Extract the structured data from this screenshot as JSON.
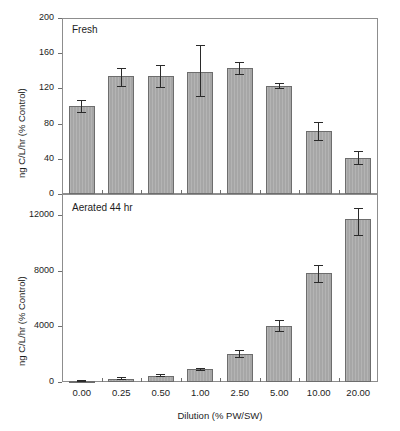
{
  "figure": {
    "shared_xlabel": "Dilution (% PW/SW)",
    "shared_ylabel": "ng C/L/hr (% Control)",
    "categories": [
      "0.00",
      "0.25",
      "0.50",
      "1.00",
      "2.50",
      "5.00",
      "10.00",
      "20.00"
    ],
    "bar_color": "#a6a6a6",
    "bar_edge_color": "#6d6d6d",
    "error_color": "#2a2a2a",
    "frame_color": "#8d8d8d"
  },
  "chart_data": [
    {
      "type": "bar",
      "title": "Fresh",
      "panel": "top",
      "xlabel": "",
      "ylabel": "ng C/L/hr (% Control)",
      "categories": [
        "0.00",
        "0.25",
        "0.50",
        "1.00",
        "2.50",
        "5.00",
        "10.00",
        "20.00"
      ],
      "values": [
        100,
        134,
        134,
        139,
        143,
        123,
        72,
        41
      ],
      "errors_low": [
        92,
        122,
        120,
        110,
        135,
        119,
        60,
        33
      ],
      "errors_high": [
        107,
        143,
        147,
        169,
        150,
        126,
        82,
        49
      ],
      "ylim": [
        0,
        200
      ],
      "yticks": [
        0,
        40,
        80,
        120,
        160,
        200
      ],
      "yticklabels": [
        "0",
        "40",
        "80",
        "120",
        "160",
        "200"
      ],
      "grid": false,
      "legend": "none",
      "annotations": [
        "Fresh"
      ]
    },
    {
      "type": "bar",
      "title": "Aerated 44 hr",
      "panel": "bottom",
      "xlabel": "Dilution (% PW/SW)",
      "ylabel": "ng C/L/hr (% Control)",
      "categories": [
        "0.00",
        "0.25",
        "0.50",
        "1.00",
        "2.50",
        "5.00",
        "10.00",
        "20.00"
      ],
      "values": [
        60,
        250,
        430,
        900,
        2000,
        4000,
        7800,
        11700
      ],
      "errors_low": [
        20,
        170,
        330,
        820,
        1750,
        3600,
        7100,
        10450
      ],
      "errors_high": [
        110,
        330,
        540,
        980,
        2270,
        4450,
        8400,
        12500
      ],
      "ylim": [
        0,
        13500
      ],
      "yticks": [
        0,
        4000,
        8000,
        12000
      ],
      "yticklabels": [
        "0",
        "4000",
        "8000",
        "12000"
      ],
      "grid": false,
      "legend": "none",
      "annotations": [
        "Aerated 44 hr"
      ]
    }
  ]
}
